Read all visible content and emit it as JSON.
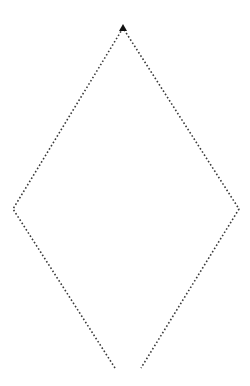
{
  "diagram": {
    "type": "dotted-rhombus-open-bottom",
    "stroke_color": "#3a3a3a",
    "arrow_color": "#111111",
    "background": "#ffffff",
    "vertices": {
      "top": [
        123,
        28
      ],
      "left": [
        13,
        209
      ],
      "right": [
        239,
        209
      ],
      "bottom_left_end": [
        115,
        368
      ],
      "bottom_right_end": [
        141,
        368
      ]
    },
    "arrowhead": {
      "position": "top",
      "shape": "filled-triangle"
    }
  }
}
